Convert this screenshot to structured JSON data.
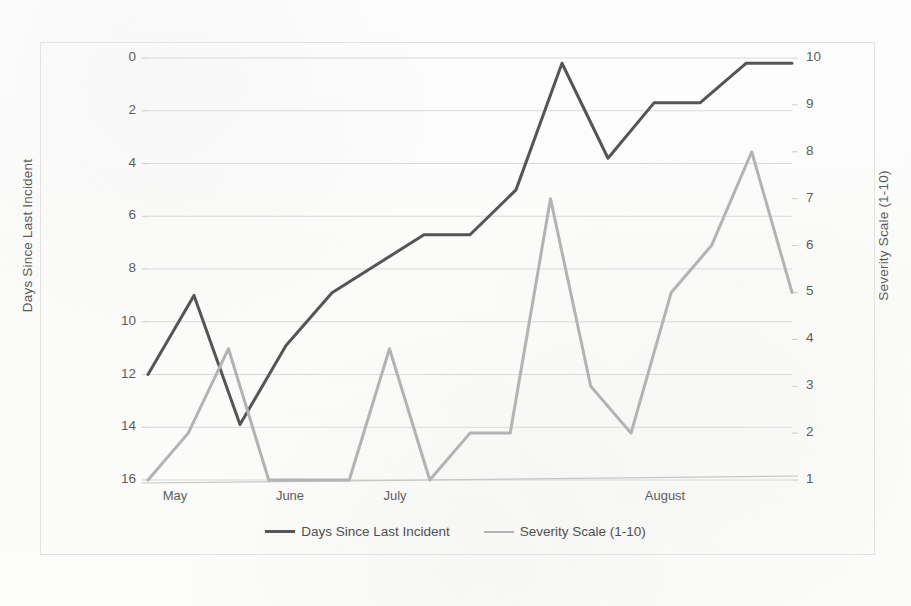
{
  "chart_data": {
    "type": "line",
    "title": "",
    "xlabel": "",
    "grid": "horizontal",
    "legend_position": "bottom",
    "x_axis": {
      "tick_labels": [
        "May",
        "June",
        "July",
        "August"
      ],
      "tick_positions_px": [
        175,
        290,
        395,
        665
      ]
    },
    "axes": [
      {
        "id": "left",
        "label": "Days Since Last Incident",
        "tick_labels": [
          "0",
          "2",
          "4",
          "6",
          "8",
          "10",
          "12",
          "14",
          "16"
        ],
        "ticks": [
          0,
          2,
          4,
          6,
          8,
          10,
          12,
          14,
          16
        ],
        "range": [
          16,
          0
        ],
        "inverted": true
      },
      {
        "id": "right",
        "label": "Severity Scale (1-10)",
        "tick_labels": [
          "10",
          "9",
          "8",
          "7",
          "6",
          "5",
          "4",
          "3",
          "2",
          "1"
        ],
        "ticks": [
          10,
          9,
          8,
          7,
          6,
          5,
          4,
          3,
          2,
          1
        ],
        "range": [
          1,
          10
        ],
        "inverted": false
      }
    ],
    "series": [
      {
        "name": "Days Since Last Incident",
        "axis": "left",
        "color": "#555555",
        "width": 3.0,
        "values": [
          12,
          9,
          13.9,
          10.9,
          8.9,
          7.8,
          6.7,
          6.7,
          5,
          0.2,
          3.8,
          1.7,
          1.7,
          0.2,
          0.2
        ]
      },
      {
        "name": "Severity Scale (1-10)",
        "axis": "right",
        "color": "#b3b3b3",
        "width": 3.0,
        "values": [
          1,
          2,
          3.8,
          1,
          1,
          1,
          3.8,
          1,
          2,
          2,
          7,
          3,
          2,
          5,
          6,
          8,
          5
        ]
      }
    ]
  },
  "legend": {
    "items": [
      {
        "label": "Days Since Last Incident",
        "color": "#555555"
      },
      {
        "label": "Severity Scale (1-10)",
        "color": "#b3b3b3"
      }
    ]
  }
}
